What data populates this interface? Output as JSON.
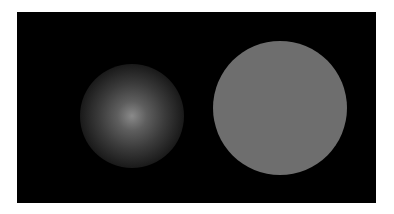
{
  "scene": {
    "background_color": "#ffffff",
    "panel_color": "#000000",
    "left_disc": {
      "kind": "blurred-gradient-disc",
      "center_color": "#8a8a8a"
    },
    "right_disc": {
      "kind": "solid-disc",
      "color": "#6e6e6e"
    }
  }
}
